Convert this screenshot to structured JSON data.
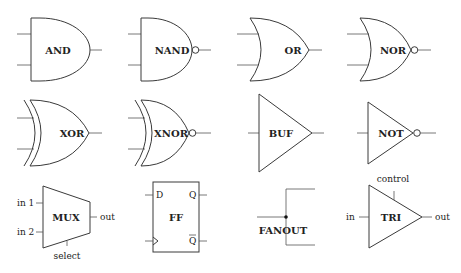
{
  "diagram": {
    "colors": {
      "stroke": "#3a3a3a",
      "text": "#222222",
      "background": "#ffffff"
    },
    "gates": {
      "and": {
        "label": "AND",
        "icon": "and-gate-icon"
      },
      "nand": {
        "label": "NAND",
        "icon": "nand-gate-icon"
      },
      "or": {
        "label": "OR",
        "icon": "or-gate-icon"
      },
      "nor": {
        "label": "NOR",
        "icon": "nor-gate-icon"
      },
      "xor": {
        "label": "XOR",
        "icon": "xor-gate-icon"
      },
      "xnor": {
        "label": "XNOR",
        "icon": "xnor-gate-icon"
      },
      "buf": {
        "label": "BUF",
        "icon": "buffer-gate-icon"
      },
      "not": {
        "label": "NOT",
        "icon": "not-gate-icon"
      },
      "mux": {
        "label": "MUX",
        "icon": "multiplexer-icon",
        "pins": {
          "in1": "in 1",
          "in2": "in 2",
          "out": "out",
          "select": "select"
        }
      },
      "ff": {
        "label": "FF",
        "icon": "flip-flop-icon",
        "pins": {
          "d": "D",
          "q": "Q",
          "qbar": "Q"
        }
      },
      "fanout": {
        "label": "FANOUT",
        "icon": "fanout-junction-icon"
      },
      "tri": {
        "label": "TRI",
        "icon": "tristate-buffer-icon",
        "pins": {
          "in": "in",
          "out": "out",
          "control": "control"
        }
      }
    }
  }
}
